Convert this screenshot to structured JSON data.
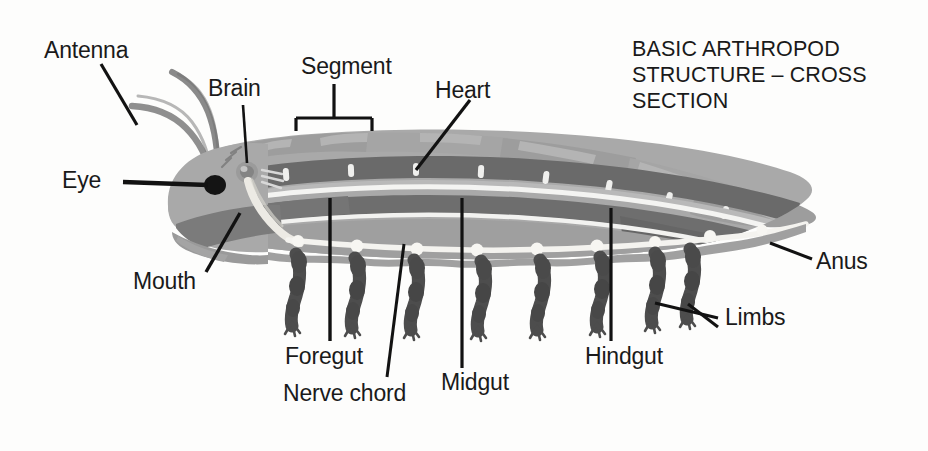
{
  "figure": {
    "title_lines": [
      "BASIC ARTHROPOD",
      "STRUCTURE – CROSS",
      "SECTION"
    ],
    "title_text": "BASIC ARTHROPOD STRUCTURE – CROSS SECTION",
    "background_color": "#fdfdfc"
  },
  "labels": {
    "antenna": "Antenna",
    "brain": "Brain",
    "segment": "Segment",
    "heart": "Heart",
    "eye": "Eye",
    "mouth": "Mouth",
    "foregut": "Foregut",
    "nerve_chord": "Nerve chord",
    "midgut": "Midgut",
    "hindgut": "Hindgut",
    "anus": "Anus",
    "limbs": "Limbs"
  },
  "colors": {
    "body_light": "#a8a8a8",
    "body_mid": "#9a9a9a",
    "organ_dark": "#6e6e6e",
    "organ_darker": "#5e5e5e",
    "limb_dark": "#4a4a4a",
    "nerve_light": "#f0f0ee",
    "eye_black": "#151515",
    "leader_line": "#111111",
    "text": "#1a1a1a"
  },
  "parts": {
    "antenna": "antenna-pair",
    "eye": "compound-eye",
    "brain": "brain-ganglion",
    "mouth": "mouthparts",
    "heart": "dorsal-heart-tube",
    "segment": "body-segment-plate",
    "foregut": "foregut",
    "midgut": "midgut",
    "hindgut": "hindgut",
    "anus": "anus",
    "nerve_chord": "ventral-nerve-chord",
    "limbs": "jointed-limbs",
    "limb_count": 8,
    "ostia_count": 8,
    "ganglia_count": 9
  }
}
